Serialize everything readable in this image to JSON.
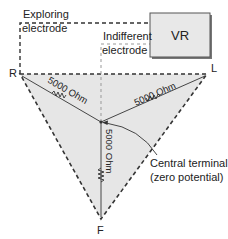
{
  "labels": {
    "exploring": [
      "Exploring",
      "electrode"
    ],
    "indifferent": [
      "Indifferent",
      "electrode"
    ],
    "vr_box": "VR",
    "vertex_r": "R",
    "vertex_l": "L",
    "vertex_f": "F",
    "resistor_rc": "5000 Ohm",
    "resistor_lc": "5000 Ohm",
    "resistor_fc": "5000 Ohm",
    "central_terminal": [
      "Central terminal",
      "(zero potential)"
    ]
  },
  "colors": {
    "triangle_fill": "#e6e6e6",
    "line": "#333333",
    "box_fill": "#e8e8e8",
    "dashed_gray": "#999999"
  }
}
